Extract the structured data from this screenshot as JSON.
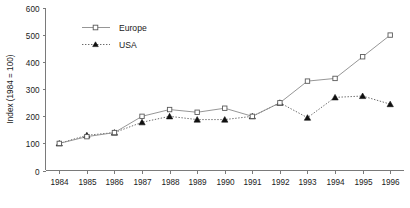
{
  "chart_data": {
    "type": "line",
    "title": "",
    "xlabel": "",
    "ylabel": "Index (1984 = 100)",
    "categories": [
      "1984",
      "1985",
      "1986",
      "1987",
      "1988",
      "1989",
      "1990",
      "1991",
      "1992",
      "1993",
      "1994",
      "1995",
      "1996"
    ],
    "x": [
      1984,
      1985,
      1986,
      1987,
      1988,
      1989,
      1990,
      1991,
      1992,
      1993,
      1994,
      1995,
      1996
    ],
    "ylim": [
      0,
      600
    ],
    "yticks": [
      0,
      100,
      200,
      300,
      400,
      500,
      600
    ],
    "ytick_labels": [
      "0",
      "100",
      "200",
      "300",
      "400",
      "500",
      "600"
    ],
    "grid": false,
    "legend_position": "top-left",
    "series": [
      {
        "name": "Europe",
        "marker": "open-square",
        "linestyle": "solid",
        "color": "#8a8a8a",
        "values": [
          100,
          125,
          140,
          200,
          225,
          215,
          230,
          200,
          250,
          330,
          340,
          420,
          500
        ]
      },
      {
        "name": "USA",
        "marker": "filled-triangle",
        "linestyle": "dotted",
        "color": "#5a5a5a",
        "values": [
          100,
          130,
          140,
          178,
          200,
          188,
          188,
          200,
          250,
          195,
          270,
          275,
          245
        ]
      }
    ]
  },
  "legend": {
    "items": [
      {
        "label": "Europe"
      },
      {
        "label": "USA"
      }
    ]
  },
  "axes": {
    "y_title": "Index (1984 = 100)"
  }
}
